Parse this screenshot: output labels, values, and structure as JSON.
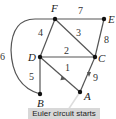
{
  "diagram": {
    "type": "graph",
    "nodes": [
      {
        "id": "F",
        "label": "F",
        "x": 55,
        "y": 19
      },
      {
        "id": "E",
        "label": "E",
        "x": 104,
        "y": 19
      },
      {
        "id": "D",
        "label": "D",
        "x": 40,
        "y": 57
      },
      {
        "id": "C",
        "label": "C",
        "x": 95,
        "y": 57
      },
      {
        "id": "B",
        "label": "B",
        "x": 40,
        "y": 94
      },
      {
        "id": "A",
        "label": "A",
        "x": 80,
        "y": 92
      }
    ],
    "edges": [
      {
        "from": "D",
        "to": "A",
        "label": "1",
        "arrow": "toward D"
      },
      {
        "from": "D",
        "to": "C",
        "label": "2"
      },
      {
        "from": "F",
        "to": "C",
        "label": "3"
      },
      {
        "from": "F",
        "to": "D",
        "label": "4"
      },
      {
        "from": "D",
        "to": "B",
        "label": "5"
      },
      {
        "from": "F",
        "to": "B",
        "label": "6",
        "curved": true
      },
      {
        "from": "F",
        "to": "E",
        "label": "7"
      },
      {
        "from": "C",
        "to": "E",
        "label": "8"
      },
      {
        "from": "C",
        "to": "A",
        "label": "9",
        "arrow": "toward A"
      }
    ],
    "callout": "Euler circuit starts",
    "colors": {
      "edge": "#555555",
      "node": "#111111",
      "callout_bg": "#d8d8d8"
    }
  }
}
